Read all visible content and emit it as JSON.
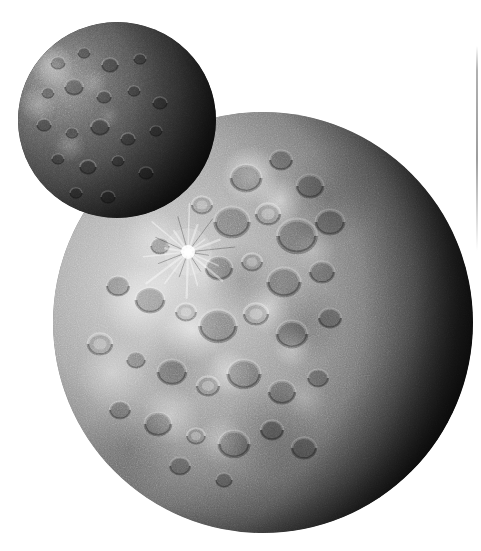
{
  "image": {
    "kind": "astronomical-photograph",
    "palette": "grayscale",
    "background_color": "#ffffff",
    "width_px": 481,
    "height_px": 551,
    "caption": "",
    "alt_text": "Two heavily cratered spherical bodies on a white background; a small dark moon overlaps the upper-left limb of a larger, brighter cratered body whose right side is in shadow."
  },
  "bodies": [
    {
      "id": "small-body",
      "name": "small-moon",
      "role": "foreground overlapping moon",
      "center_x": 117,
      "center_y": 120,
      "radius": 99,
      "overall_tone": "dark",
      "surface": "densely cratered, low albedo",
      "illumination": "lit from upper-left, terminator shadow on right and lower-right",
      "base_color": "#4e4e4e",
      "shadow_color": "#060606",
      "highlight_color": "#9a9a9a"
    },
    {
      "id": "large-body",
      "name": "large-moon",
      "role": "background primary body",
      "center_x": 263,
      "center_y": 322,
      "radius": 210,
      "overall_tone": "bright grey",
      "surface": "saturated with overlapping impact craters and bright ejecta patches",
      "illumination": "lit from the left, night side occupying the right third of the disc",
      "base_color": "#a2a2a2",
      "shadow_color": "#0b0b0b",
      "highlight_color": "#ffffff"
    }
  ],
  "features": [
    {
      "id": "ray-crater",
      "label": "bright ray crater",
      "body": "large-body",
      "center_x": 188,
      "center_y": 252,
      "radius": 7,
      "ray_count": 22,
      "ray_length": 46,
      "description": "small bright crater with radiating bright and dark ray system"
    },
    {
      "id": "terminator",
      "label": "terminator",
      "body": "large-body",
      "description": "day/night boundary sweeping from upper right down to lower centre"
    },
    {
      "id": "bright-ejecta-field",
      "label": "bright ejecta patches",
      "body": "large-body",
      "description": "cluster of high-albedo splotches across the illuminated hemisphere"
    }
  ],
  "artifacts": [
    {
      "id": "scan-line",
      "label": "scan edge line",
      "x": 477,
      "y_start": 46,
      "y_end": 251,
      "color": "#8c8c8c",
      "description": "faint vertical grey line near the right margin of the scan"
    }
  ],
  "chart_data": {
    "type": "scatter",
    "title": "",
    "xlabel": "",
    "ylabel": "",
    "series": [
      {
        "name": "large-body-craters",
        "note": "approximate crater positions and radii in image pixels on the large body",
        "points": [
          {
            "x": 246,
            "y": 178,
            "r": 15,
            "tone": "dark"
          },
          {
            "x": 281,
            "y": 160,
            "r": 11,
            "tone": "dark"
          },
          {
            "x": 310,
            "y": 186,
            "r": 13,
            "tone": "dark"
          },
          {
            "x": 202,
            "y": 205,
            "r": 10,
            "tone": "light"
          },
          {
            "x": 232,
            "y": 222,
            "r": 17,
            "tone": "dark"
          },
          {
            "x": 268,
            "y": 214,
            "r": 12,
            "tone": "light"
          },
          {
            "x": 297,
            "y": 236,
            "r": 19,
            "tone": "dark"
          },
          {
            "x": 330,
            "y": 222,
            "r": 14,
            "tone": "dark"
          },
          {
            "x": 160,
            "y": 246,
            "r": 9,
            "tone": "dark"
          },
          {
            "x": 188,
            "y": 252,
            "r": 7,
            "tone": "bright"
          },
          {
            "x": 219,
            "y": 268,
            "r": 13,
            "tone": "dark"
          },
          {
            "x": 252,
            "y": 262,
            "r": 10,
            "tone": "light"
          },
          {
            "x": 284,
            "y": 282,
            "r": 16,
            "tone": "dark"
          },
          {
            "x": 322,
            "y": 272,
            "r": 12,
            "tone": "dark"
          },
          {
            "x": 118,
            "y": 286,
            "r": 11,
            "tone": "dark"
          },
          {
            "x": 150,
            "y": 300,
            "r": 14,
            "tone": "dark"
          },
          {
            "x": 186,
            "y": 312,
            "r": 10,
            "tone": "light"
          },
          {
            "x": 218,
            "y": 326,
            "r": 18,
            "tone": "dark"
          },
          {
            "x": 256,
            "y": 314,
            "r": 12,
            "tone": "light"
          },
          {
            "x": 292,
            "y": 334,
            "r": 15,
            "tone": "dark"
          },
          {
            "x": 330,
            "y": 318,
            "r": 11,
            "tone": "dark"
          },
          {
            "x": 100,
            "y": 344,
            "r": 12,
            "tone": "light"
          },
          {
            "x": 136,
            "y": 360,
            "r": 9,
            "tone": "dark"
          },
          {
            "x": 172,
            "y": 372,
            "r": 14,
            "tone": "dark"
          },
          {
            "x": 208,
            "y": 386,
            "r": 11,
            "tone": "light"
          },
          {
            "x": 244,
            "y": 374,
            "r": 16,
            "tone": "dark"
          },
          {
            "x": 282,
            "y": 392,
            "r": 13,
            "tone": "dark"
          },
          {
            "x": 318,
            "y": 378,
            "r": 10,
            "tone": "dark"
          },
          {
            "x": 120,
            "y": 410,
            "r": 10,
            "tone": "dark"
          },
          {
            "x": 158,
            "y": 424,
            "r": 13,
            "tone": "dark"
          },
          {
            "x": 196,
            "y": 436,
            "r": 9,
            "tone": "light"
          },
          {
            "x": 234,
            "y": 444,
            "r": 15,
            "tone": "dark"
          },
          {
            "x": 272,
            "y": 430,
            "r": 11,
            "tone": "dark"
          },
          {
            "x": 304,
            "y": 448,
            "r": 12,
            "tone": "dark"
          },
          {
            "x": 180,
            "y": 466,
            "r": 10,
            "tone": "dark"
          },
          {
            "x": 224,
            "y": 480,
            "r": 8,
            "tone": "dark"
          }
        ]
      },
      {
        "name": "small-body-craters",
        "note": "approximate crater positions and radii in image pixels on the small moon",
        "points": [
          {
            "x": 58,
            "y": 62,
            "r": 7,
            "tone": "dark"
          },
          {
            "x": 84,
            "y": 52,
            "r": 6,
            "tone": "dark"
          },
          {
            "x": 110,
            "y": 64,
            "r": 8,
            "tone": "dark"
          },
          {
            "x": 140,
            "y": 58,
            "r": 6,
            "tone": "dark"
          },
          {
            "x": 48,
            "y": 92,
            "r": 6,
            "tone": "dark"
          },
          {
            "x": 74,
            "y": 86,
            "r": 9,
            "tone": "dark"
          },
          {
            "x": 104,
            "y": 96,
            "r": 7,
            "tone": "dark"
          },
          {
            "x": 134,
            "y": 90,
            "r": 6,
            "tone": "dark"
          },
          {
            "x": 160,
            "y": 102,
            "r": 7,
            "tone": "dark"
          },
          {
            "x": 44,
            "y": 124,
            "r": 7,
            "tone": "dark"
          },
          {
            "x": 72,
            "y": 132,
            "r": 6,
            "tone": "dark"
          },
          {
            "x": 100,
            "y": 126,
            "r": 9,
            "tone": "dark"
          },
          {
            "x": 128,
            "y": 138,
            "r": 7,
            "tone": "dark"
          },
          {
            "x": 156,
            "y": 130,
            "r": 6,
            "tone": "dark"
          },
          {
            "x": 58,
            "y": 158,
            "r": 6,
            "tone": "dark"
          },
          {
            "x": 88,
            "y": 166,
            "r": 8,
            "tone": "dark"
          },
          {
            "x": 118,
            "y": 160,
            "r": 6,
            "tone": "dark"
          },
          {
            "x": 146,
            "y": 172,
            "r": 7,
            "tone": "dark"
          },
          {
            "x": 76,
            "y": 192,
            "r": 6,
            "tone": "dark"
          },
          {
            "x": 108,
            "y": 196,
            "r": 7,
            "tone": "dark"
          }
        ]
      }
    ]
  }
}
